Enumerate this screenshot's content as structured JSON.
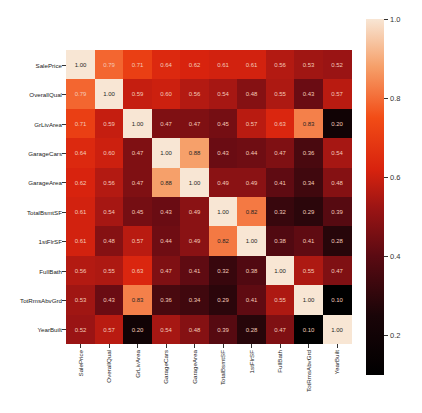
{
  "chart_data": {
    "type": "heatmap",
    "title": "",
    "xlabel": "",
    "ylabel": "",
    "labels": [
      "SalePrice",
      "OverallQual",
      "GrLivArea",
      "GarageCars",
      "GarageArea",
      "TotalBsmtSF",
      "1stFlrSF",
      "FullBath",
      "TotRmsAbvGrd",
      "YearBuilt"
    ],
    "values": [
      [
        1.0,
        0.79,
        0.71,
        0.64,
        0.62,
        0.61,
        0.61,
        0.56,
        0.53,
        0.52
      ],
      [
        0.79,
        1.0,
        0.59,
        0.6,
        0.56,
        0.54,
        0.48,
        0.55,
        0.43,
        0.57
      ],
      [
        0.71,
        0.59,
        1.0,
        0.47,
        0.47,
        0.45,
        0.57,
        0.63,
        0.83,
        0.2
      ],
      [
        0.64,
        0.6,
        0.47,
        1.0,
        0.88,
        0.43,
        0.44,
        0.47,
        0.36,
        0.54
      ],
      [
        0.62,
        0.56,
        0.47,
        0.88,
        1.0,
        0.49,
        0.49,
        0.41,
        0.34,
        0.48
      ],
      [
        0.61,
        0.54,
        0.45,
        0.43,
        0.49,
        1.0,
        0.82,
        0.32,
        0.29,
        0.39
      ],
      [
        0.61,
        0.48,
        0.57,
        0.44,
        0.49,
        0.82,
        1.0,
        0.38,
        0.41,
        0.28
      ],
      [
        0.56,
        0.55,
        0.63,
        0.47,
        0.41,
        0.32,
        0.38,
        1.0,
        0.55,
        0.47
      ],
      [
        0.53,
        0.43,
        0.83,
        0.36,
        0.34,
        0.29,
        0.41,
        0.55,
        1.0,
        0.1
      ],
      [
        0.52,
        0.57,
        0.2,
        0.54,
        0.48,
        0.39,
        0.28,
        0.47,
        0.1,
        1.0
      ]
    ],
    "value_format": "0.00",
    "colorbar": {
      "min": 0.1,
      "max": 1.0,
      "ticks": [
        1.0,
        0.8,
        0.6,
        0.4,
        0.2
      ],
      "tick_labels": [
        "1.0",
        "0.8",
        "0.6",
        "0.4",
        "0.2"
      ],
      "colormap_stops": [
        {
          "v": 0.1,
          "color": "#000000"
        },
        {
          "v": 0.25,
          "color": "#1a0508"
        },
        {
          "v": 0.4,
          "color": "#5a0a12"
        },
        {
          "v": 0.52,
          "color": "#9a1414"
        },
        {
          "v": 0.62,
          "color": "#d8230e"
        },
        {
          "v": 0.75,
          "color": "#f24c16"
        },
        {
          "v": 0.88,
          "color": "#f6a06a"
        },
        {
          "v": 1.0,
          "color": "#f8e6d4"
        }
      ]
    },
    "legend_position": "right",
    "grid": false
  }
}
